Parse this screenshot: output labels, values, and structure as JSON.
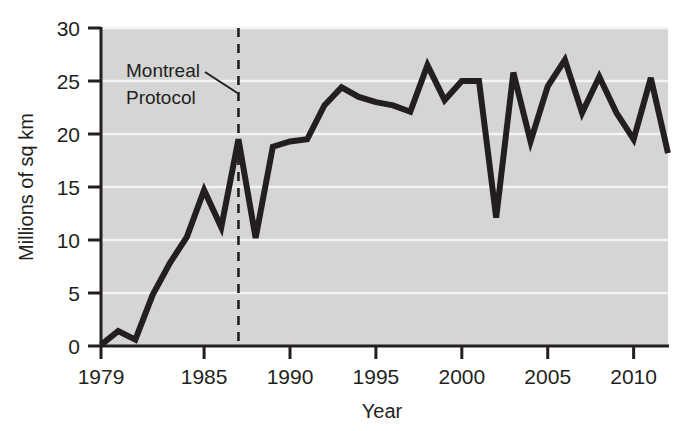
{
  "chart_data": {
    "type": "line",
    "title": "",
    "xlabel": "Year",
    "ylabel": "Millions of sq km",
    "xlim": [
      1979,
      2012
    ],
    "ylim": [
      0,
      30
    ],
    "xticks": [
      1979,
      1985,
      1990,
      1995,
      2000,
      2005,
      2010
    ],
    "xtick_labels": [
      "1979",
      "1985",
      "1990",
      "1995",
      "2000",
      "2005",
      "2010"
    ],
    "yticks": [
      0,
      5,
      10,
      15,
      20,
      25,
      30
    ],
    "ytick_labels": [
      "0",
      "5",
      "10",
      "15",
      "20",
      "25",
      "30"
    ],
    "grid": "horizontal",
    "legend": "none",
    "x": [
      1979,
      1980,
      1981,
      1982,
      1983,
      1984,
      1985,
      1986,
      1987,
      1988,
      1989,
      1990,
      1991,
      1992,
      1993,
      1994,
      1995,
      1996,
      1997,
      1998,
      1999,
      2000,
      2001,
      2002,
      2003,
      2004,
      2005,
      2006,
      2007,
      2008,
      2009,
      2010,
      2011,
      2012
    ],
    "values": [
      0.1,
      1.4,
      0.6,
      4.8,
      7.8,
      10.3,
      14.7,
      11.2,
      19.5,
      10.2,
      18.8,
      19.3,
      19.5,
      22.7,
      24.4,
      23.5,
      23.0,
      22.7,
      22.1,
      26.5,
      23.2,
      25.0,
      25.0,
      12.1,
      25.8,
      19.3,
      24.5,
      27.0,
      22.0,
      25.4,
      22.0,
      19.5,
      25.3,
      18.2
    ],
    "series_name": "Antarctic ozone hole area",
    "line_color": "#231f20",
    "plot_background": "#d5d5d5",
    "gridline_color": "#f4f4f4",
    "annotations": [
      {
        "name": "montreal-protocol",
        "line1": "Montreal",
        "line2": "Protocol",
        "x_value": 1987,
        "marker": "dashed-vertical-line"
      }
    ]
  },
  "axes": {
    "y_title": "Millions of sq km",
    "x_title": "Year"
  }
}
